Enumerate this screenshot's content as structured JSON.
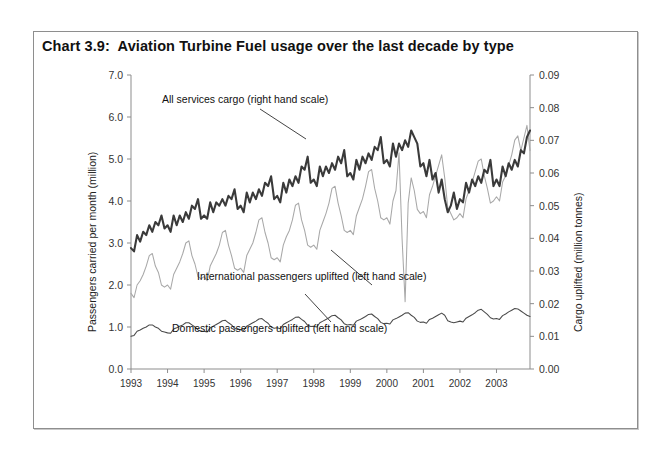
{
  "chart_title": "Chart 3.9:  Aviation Turbine Fuel usage over the last decade by type",
  "axes": {
    "left_title": "Passengers carried per month (million)",
    "right_title": "Cargo uplifted (million tonnes)",
    "left_ticks": [
      "0.0",
      "1.0",
      "2.0",
      "3.0",
      "4.0",
      "5.0",
      "6.0",
      "7.0"
    ],
    "right_ticks": [
      "0.00",
      "0.01",
      "0.02",
      "0.03",
      "0.04",
      "0.05",
      "0.06",
      "0.07",
      "0.08",
      "0.09"
    ],
    "x_ticks": [
      "1993",
      "1994",
      "1995",
      "1996",
      "1997",
      "1998",
      "1999",
      "2000",
      "2001",
      "2002",
      "2003"
    ]
  },
  "annotations": {
    "cargo": "All services cargo (right hand scale)",
    "international": "International passengers uplifted (left hand scale)",
    "domestic": "Domestic passengers uplifted (left  hand scale)"
  },
  "colors": {
    "cargo_line": "#3a3a3a",
    "international_line": "#a8a8a8",
    "domestic_line": "#4a4a4a",
    "axis": "#8d8d8d",
    "frame": "#8e8e8e"
  },
  "chart_data": {
    "type": "line",
    "title": "Chart 3.9:  Aviation Turbine Fuel usage over the last decade by type",
    "xlabel": "",
    "ylabel": "Passengers carried per month (million)",
    "y2label": "Cargo uplifted (million tonnes)",
    "ylim": [
      0.0,
      7.0
    ],
    "y2lim": [
      0.0,
      0.09
    ],
    "xlim": [
      "1993-01",
      "2003-12"
    ],
    "grid": false,
    "legend": "annotations on plot",
    "x_tick_labels": [
      "1993",
      "1994",
      "1995",
      "1996",
      "1997",
      "1998",
      "1999",
      "2000",
      "2001",
      "2002",
      "2003"
    ],
    "x_months": [
      "1993-01",
      "1993-02",
      "1993-03",
      "1993-04",
      "1993-05",
      "1993-06",
      "1993-07",
      "1993-08",
      "1993-09",
      "1993-10",
      "1993-11",
      "1993-12",
      "1994-01",
      "1994-02",
      "1994-03",
      "1994-04",
      "1994-05",
      "1994-06",
      "1994-07",
      "1994-08",
      "1994-09",
      "1994-10",
      "1994-11",
      "1994-12",
      "1995-01",
      "1995-02",
      "1995-03",
      "1995-04",
      "1995-05",
      "1995-06",
      "1995-07",
      "1995-08",
      "1995-09",
      "1995-10",
      "1995-11",
      "1995-12",
      "1996-01",
      "1996-02",
      "1996-03",
      "1996-04",
      "1996-05",
      "1996-06",
      "1996-07",
      "1996-08",
      "1996-09",
      "1996-10",
      "1996-11",
      "1996-12",
      "1997-01",
      "1997-02",
      "1997-03",
      "1997-04",
      "1997-05",
      "1997-06",
      "1997-07",
      "1997-08",
      "1997-09",
      "1997-10",
      "1997-11",
      "1997-12",
      "1998-01",
      "1998-02",
      "1998-03",
      "1998-04",
      "1998-05",
      "1998-06",
      "1998-07",
      "1998-08",
      "1998-09",
      "1998-10",
      "1998-11",
      "1998-12",
      "1999-01",
      "1999-02",
      "1999-03",
      "1999-04",
      "1999-05",
      "1999-06",
      "1999-07",
      "1999-08",
      "1999-09",
      "1999-10",
      "1999-11",
      "1999-12",
      "2000-01",
      "2000-02",
      "2000-03",
      "2000-04",
      "2000-05",
      "2000-06",
      "2000-07",
      "2000-08",
      "2000-09",
      "2000-10",
      "2000-11",
      "2000-12",
      "2001-01",
      "2001-02",
      "2001-03",
      "2001-04",
      "2001-05",
      "2001-06",
      "2001-07",
      "2001-08",
      "2001-09",
      "2001-10",
      "2001-11",
      "2001-12",
      "2002-01",
      "2002-02",
      "2002-03",
      "2002-04",
      "2002-05",
      "2002-06",
      "2002-07",
      "2002-08",
      "2002-09",
      "2002-10",
      "2002-11",
      "2002-12",
      "2003-01",
      "2003-02",
      "2003-03",
      "2003-04",
      "2003-05",
      "2003-06",
      "2003-07",
      "2003-08",
      "2003-09",
      "2003-10",
      "2003-11",
      "2003-12"
    ],
    "series": [
      {
        "name": "All services cargo (right hand scale)",
        "axis": "right",
        "units": "million tonnes",
        "color": "#3a3a3a",
        "values": [
          0.037,
          0.036,
          0.041,
          0.039,
          0.042,
          0.041,
          0.044,
          0.042,
          0.045,
          0.044,
          0.047,
          0.043,
          0.044,
          0.042,
          0.047,
          0.044,
          0.047,
          0.045,
          0.048,
          0.046,
          0.05,
          0.049,
          0.052,
          0.046,
          0.047,
          0.046,
          0.051,
          0.048,
          0.051,
          0.05,
          0.052,
          0.05,
          0.053,
          0.052,
          0.055,
          0.049,
          0.05,
          0.048,
          0.054,
          0.051,
          0.054,
          0.052,
          0.055,
          0.053,
          0.057,
          0.056,
          0.059,
          0.052,
          0.053,
          0.051,
          0.057,
          0.054,
          0.058,
          0.056,
          0.059,
          0.057,
          0.062,
          0.061,
          0.065,
          0.057,
          0.058,
          0.056,
          0.062,
          0.059,
          0.062,
          0.06,
          0.063,
          0.061,
          0.065,
          0.063,
          0.067,
          0.059,
          0.06,
          0.058,
          0.064,
          0.061,
          0.065,
          0.063,
          0.066,
          0.064,
          0.068,
          0.067,
          0.071,
          0.063,
          0.064,
          0.062,
          0.069,
          0.065,
          0.069,
          0.067,
          0.07,
          0.068,
          0.073,
          0.071,
          0.069,
          0.062,
          0.063,
          0.059,
          0.064,
          0.058,
          0.06,
          0.054,
          0.058,
          0.052,
          0.048,
          0.05,
          0.054,
          0.049,
          0.052,
          0.051,
          0.057,
          0.054,
          0.058,
          0.056,
          0.059,
          0.057,
          0.061,
          0.06,
          0.064,
          0.056,
          0.058,
          0.056,
          0.062,
          0.059,
          0.063,
          0.061,
          0.064,
          0.062,
          0.067,
          0.066,
          0.071,
          0.073
        ]
      },
      {
        "name": "International passengers uplifted (left hand scale)",
        "axis": "left",
        "units": "million",
        "color": "#a8a8a8",
        "values": [
          1.8,
          1.7,
          2.0,
          2.1,
          2.25,
          2.45,
          2.7,
          2.75,
          2.45,
          2.3,
          2.0,
          1.95,
          2.0,
          1.9,
          2.25,
          2.4,
          2.55,
          2.75,
          3.0,
          3.05,
          2.7,
          2.5,
          2.2,
          2.15,
          2.2,
          2.1,
          2.45,
          2.6,
          2.75,
          2.95,
          3.25,
          3.3,
          2.95,
          2.7,
          2.4,
          2.35,
          2.4,
          2.3,
          2.7,
          2.85,
          3.0,
          3.25,
          3.55,
          3.6,
          3.25,
          3.0,
          2.65,
          2.6,
          2.65,
          2.55,
          2.95,
          3.15,
          3.3,
          3.55,
          3.9,
          3.95,
          3.55,
          3.3,
          2.95,
          2.9,
          2.95,
          2.85,
          3.3,
          3.5,
          3.7,
          3.95,
          4.3,
          4.35,
          3.95,
          3.65,
          3.3,
          3.25,
          3.3,
          3.2,
          3.65,
          3.85,
          4.05,
          4.35,
          4.7,
          4.75,
          4.3,
          4.0,
          3.6,
          3.55,
          3.6,
          3.45,
          4.0,
          4.25,
          5.15,
          3.1,
          1.6,
          3.95,
          4.55,
          4.25,
          3.8,
          3.7,
          3.75,
          3.6,
          4.15,
          4.35,
          4.6,
          4.85,
          5.1,
          4.55,
          3.85,
          3.7,
          3.55,
          3.6,
          3.7,
          3.6,
          4.05,
          4.25,
          4.45,
          4.7,
          4.95,
          5.0,
          4.6,
          4.3,
          3.95,
          4.0,
          4.1,
          4.0,
          4.45,
          4.6,
          4.85,
          5.1,
          5.45,
          5.55,
          5.2,
          5.5,
          5.8,
          5.2
        ]
      },
      {
        "name": "Domestic passengers uplifted (left  hand scale)",
        "axis": "left",
        "units": "million",
        "color": "#4a4a4a",
        "values": [
          0.78,
          0.8,
          0.9,
          0.93,
          0.97,
          1.0,
          1.05,
          1.05,
          1.0,
          0.97,
          0.9,
          0.88,
          0.86,
          0.85,
          0.95,
          0.98,
          1.02,
          1.05,
          1.1,
          1.1,
          1.05,
          1.0,
          0.93,
          0.9,
          0.9,
          0.88,
          0.98,
          1.02,
          1.06,
          1.1,
          1.15,
          1.16,
          1.1,
          1.05,
          0.97,
          0.94,
          0.94,
          0.92,
          1.02,
          1.06,
          1.1,
          1.14,
          1.19,
          1.2,
          1.14,
          1.09,
          1.0,
          0.97,
          0.98,
          0.96,
          1.06,
          1.1,
          1.14,
          1.18,
          1.23,
          1.24,
          1.18,
          1.13,
          1.04,
          1.01,
          1.02,
          1.0,
          1.1,
          1.14,
          1.18,
          1.22,
          1.27,
          1.28,
          1.22,
          1.17,
          1.08,
          1.05,
          1.06,
          1.04,
          1.14,
          1.17,
          1.21,
          1.25,
          1.3,
          1.31,
          1.25,
          1.2,
          1.11,
          1.08,
          1.09,
          1.07,
          1.17,
          1.2,
          1.24,
          1.28,
          1.33,
          1.34,
          1.28,
          1.23,
          1.14,
          1.11,
          1.12,
          1.09,
          1.18,
          1.21,
          1.25,
          1.29,
          1.33,
          1.28,
          1.15,
          1.12,
          1.1,
          1.12,
          1.14,
          1.12,
          1.21,
          1.25,
          1.29,
          1.34,
          1.4,
          1.42,
          1.36,
          1.3,
          1.22,
          1.19,
          1.2,
          1.18,
          1.27,
          1.31,
          1.36,
          1.4,
          1.44,
          1.43,
          1.38,
          1.33,
          1.28,
          1.25
        ]
      }
    ]
  }
}
